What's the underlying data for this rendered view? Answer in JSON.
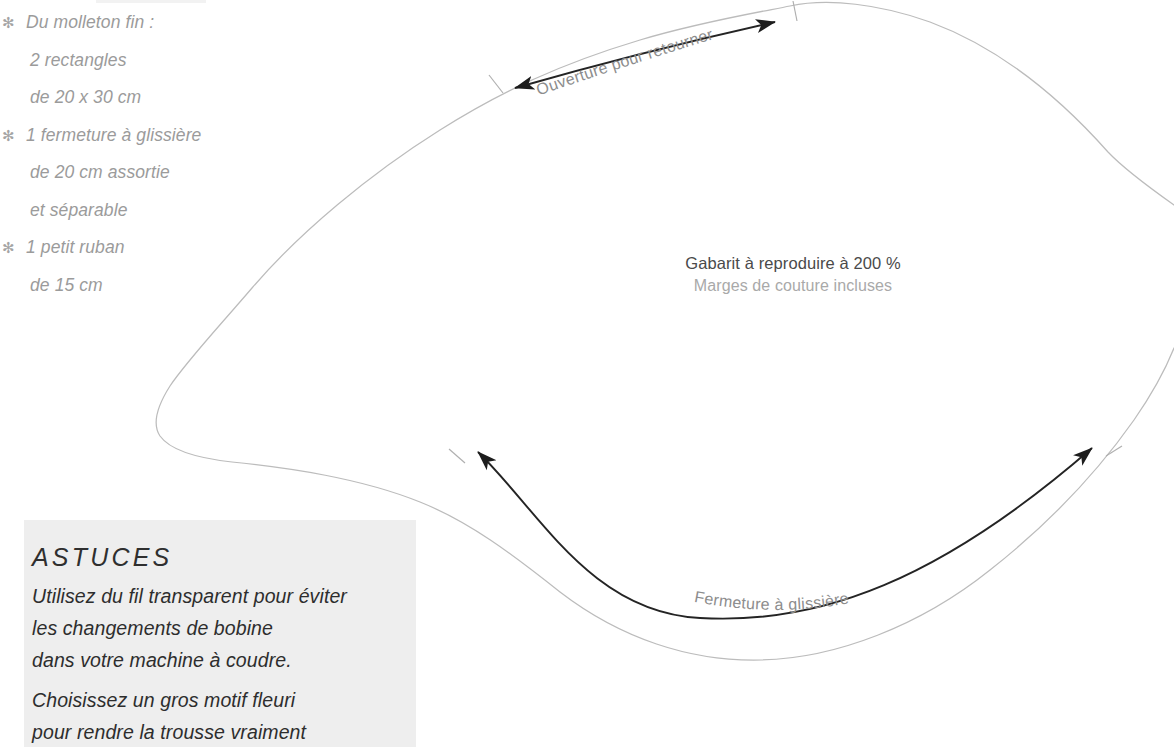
{
  "document": {
    "type": "sewing-pattern-template",
    "language": "fr"
  },
  "materials": {
    "bullet_glyph": "✻",
    "items": [
      {
        "bullet": true,
        "text": "Du molleton fin :"
      },
      {
        "bullet": false,
        "text": "2 rectangles"
      },
      {
        "bullet": false,
        "text": "de 20 x 30 cm"
      },
      {
        "bullet": true,
        "text": "1 fermeture à glissière"
      },
      {
        "bullet": false,
        "text": "de 20 cm assortie"
      },
      {
        "bullet": false,
        "text": "et séparable"
      },
      {
        "bullet": true,
        "text": "1 petit ruban"
      },
      {
        "bullet": false,
        "text": "de 15 cm"
      }
    ]
  },
  "center_caption": {
    "main": "Gabarit à reproduire à 200 %",
    "sub": "Marges de couture incluses",
    "scale_percent": "200 %"
  },
  "pattern_labels": {
    "top_arrow": "Ouverture pour retourner",
    "bottom_arrow": "Fermeture à glissière"
  },
  "astuces": {
    "title": "ASTUCES",
    "paragraphs": [
      [
        "Utilisez du fil transparent pour éviter",
        "les changements de bobine",
        "dans votre machine à coudre."
      ],
      [
        "Choisissez un gros motif fleuri",
        "pour rendre la trousse vraiment"
      ]
    ]
  },
  "colors": {
    "pattern_outline": "#b9b9b9",
    "arrow_dark": "#242424",
    "materials_text": "#9b9b9b",
    "caption_main": "#4a4a4a",
    "caption_sub": "#a9a9a9",
    "astuces_bg": "#eeeeee",
    "astuces_text": "#2d2d2d",
    "label_text": "#8d8d8d",
    "page_bg": "#ffffff"
  }
}
